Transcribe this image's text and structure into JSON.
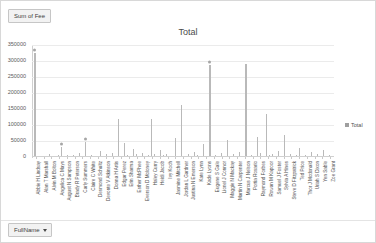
{
  "window": {
    "field_pill_label": "Sum of Fee",
    "axis_pill_label": "FullName",
    "axis_pill_caret": "chevron-down-icon"
  },
  "legend": {
    "position": "right",
    "entries": [
      {
        "label": "Total",
        "color": "#9f9f9f",
        "marker": "square"
      }
    ]
  },
  "chart_data": {
    "type": "bar",
    "title": "Total",
    "xlabel": "",
    "ylabel": "",
    "ylim": [
      0,
      350000
    ],
    "yticks": [
      0,
      50000,
      100000,
      150000,
      200000,
      250000,
      300000,
      350000
    ],
    "ytick_labels": [
      "0",
      "50000",
      "100000",
      "150000",
      "200000",
      "250000",
      "300000",
      "350000"
    ],
    "grid": true,
    "grid_axis": "y",
    "legend": [
      "Total"
    ],
    "series_name": "Total",
    "categories": [
      "Abbie H Lindsay",
      "Alan T Marshall",
      "Alvin M Bolton",
      "Angelica C Mays",
      "August N Sampson",
      "Brady R Peterson",
      "Carly Summers",
      "Claire C White",
      "Desmond Schultz",
      "Devonte V Atkinson",
      "Donna H Artis",
      "Edgar Perez",
      "Erin Sharma",
      "Esther McPhee",
      "Everson D Moloney",
      "Haley Curry",
      "Heidi Jacob",
      "Ivy Koch",
      "Jasmine Mitchell",
      "Jordan L Gardner",
      "Justina N Emerson",
      "Kate Lynn",
      "Kade Lyons",
      "Eugene S Gale",
      "Lionel J Connor",
      "Maggie N Mackay",
      "Martin N Carpenter",
      "Marcus J Nelson",
      "Portia Rosario",
      "Raymond Forbes",
      "Rowan M Kapoor",
      "Samuel J Foster",
      "Sylvia A Hines",
      "Steve D Fitzpatrick",
      "Ted Price",
      "Thor J Mcdonald",
      "Uriah S Dixon",
      "Yen Sable",
      "Zoe Grant"
    ],
    "values": [
      325000,
      4200,
      9500,
      6100,
      31000,
      7400,
      12500,
      48000,
      5200,
      3900,
      18000,
      8600,
      11200,
      3100,
      45000,
      6800,
      24000,
      9100,
      13500,
      5600,
      7900,
      21000,
      10400,
      4300,
      163000,
      8200,
      14600,
      287000,
      6400,
      11800,
      52000,
      9700,
      16200,
      290000,
      7100,
      12900,
      135000,
      8800,
      19500
    ],
    "points": [
      {
        "value": 325000,
        "marker": true
      },
      {
        "value": 2100,
        "marker": false
      },
      {
        "value": 900,
        "marker": false
      },
      {
        "value": 4200,
        "marker": false
      },
      {
        "value": 1400,
        "marker": false
      },
      {
        "value": 9500,
        "marker": false
      },
      {
        "value": 2800,
        "marker": false
      },
      {
        "value": 700,
        "marker": false
      },
      {
        "value": 6100,
        "marker": false
      },
      {
        "value": 31000,
        "marker": true
      },
      {
        "value": 1800,
        "marker": false
      },
      {
        "value": 5400,
        "marker": false
      },
      {
        "value": 2300,
        "marker": false
      },
      {
        "value": 7400,
        "marker": false
      },
      {
        "value": 1100,
        "marker": false
      },
      {
        "value": 12500,
        "marker": false
      },
      {
        "value": 3600,
        "marker": false
      },
      {
        "value": 48000,
        "marker": true
      },
      {
        "value": 2000,
        "marker": false
      },
      {
        "value": 5200,
        "marker": false
      },
      {
        "value": 1500,
        "marker": false
      },
      {
        "value": 3900,
        "marker": false
      },
      {
        "value": 18000,
        "marker": false
      },
      {
        "value": 2600,
        "marker": false
      },
      {
        "value": 8600,
        "marker": false
      },
      {
        "value": 1200,
        "marker": false
      },
      {
        "value": 11200,
        "marker": false
      },
      {
        "value": 3100,
        "marker": false
      },
      {
        "value": 120000,
        "marker": false
      },
      {
        "value": 2400,
        "marker": false
      },
      {
        "value": 45000,
        "marker": false
      },
      {
        "value": 6800,
        "marker": false
      },
      {
        "value": 1600,
        "marker": false
      },
      {
        "value": 24000,
        "marker": false
      },
      {
        "value": 9100,
        "marker": false
      },
      {
        "value": 2900,
        "marker": false
      },
      {
        "value": 13500,
        "marker": false
      },
      {
        "value": 1300,
        "marker": false
      },
      {
        "value": 5600,
        "marker": false
      },
      {
        "value": 118000,
        "marker": false
      },
      {
        "value": 7900,
        "marker": false
      },
      {
        "value": 2200,
        "marker": false
      },
      {
        "value": 21000,
        "marker": false
      },
      {
        "value": 4800,
        "marker": false
      },
      {
        "value": 10400,
        "marker": false
      },
      {
        "value": 1700,
        "marker": false
      },
      {
        "value": 4300,
        "marker": false
      },
      {
        "value": 58000,
        "marker": false
      },
      {
        "value": 2500,
        "marker": false
      },
      {
        "value": 163000,
        "marker": false
      },
      {
        "value": 3300,
        "marker": false
      },
      {
        "value": 8200,
        "marker": false
      },
      {
        "value": 1900,
        "marker": false
      },
      {
        "value": 14600,
        "marker": false
      },
      {
        "value": 5100,
        "marker": false
      },
      {
        "value": 2700,
        "marker": false
      },
      {
        "value": 42000,
        "marker": false
      },
      {
        "value": 1000,
        "marker": false
      },
      {
        "value": 287000,
        "marker": true
      },
      {
        "value": 3400,
        "marker": false
      },
      {
        "value": 6400,
        "marker": false
      },
      {
        "value": 1450,
        "marker": false
      },
      {
        "value": 11800,
        "marker": false
      },
      {
        "value": 2050,
        "marker": false
      },
      {
        "value": 52000,
        "marker": false
      },
      {
        "value": 4600,
        "marker": false
      },
      {
        "value": 9700,
        "marker": false
      },
      {
        "value": 1350,
        "marker": false
      },
      {
        "value": 16200,
        "marker": false
      },
      {
        "value": 3050,
        "marker": false
      },
      {
        "value": 290000,
        "marker": false
      },
      {
        "value": 2150,
        "marker": false
      },
      {
        "value": 7100,
        "marker": false
      },
      {
        "value": 1250,
        "marker": false
      },
      {
        "value": 61000,
        "marker": false
      },
      {
        "value": 12900,
        "marker": false
      },
      {
        "value": 2750,
        "marker": false
      },
      {
        "value": 135000,
        "marker": false
      },
      {
        "value": 4900,
        "marker": false
      },
      {
        "value": 8800,
        "marker": false
      },
      {
        "value": 1550,
        "marker": false
      },
      {
        "value": 19500,
        "marker": false
      },
      {
        "value": 3750,
        "marker": false
      },
      {
        "value": 68000,
        "marker": false
      },
      {
        "value": 2350,
        "marker": false
      },
      {
        "value": 10900,
        "marker": false
      },
      {
        "value": 1150,
        "marker": false
      },
      {
        "value": 5800,
        "marker": false
      },
      {
        "value": 29000,
        "marker": false
      },
      {
        "value": 2650,
        "marker": false
      },
      {
        "value": 7600,
        "marker": false
      },
      {
        "value": 1050,
        "marker": false
      },
      {
        "value": 14200,
        "marker": false
      },
      {
        "value": 3250,
        "marker": false
      },
      {
        "value": 9300,
        "marker": false
      },
      {
        "value": 1650,
        "marker": false
      },
      {
        "value": 22500,
        "marker": false
      },
      {
        "value": 4150,
        "marker": false
      },
      {
        "value": 6900,
        "marker": false
      },
      {
        "value": 1950,
        "marker": false
      }
    ]
  }
}
